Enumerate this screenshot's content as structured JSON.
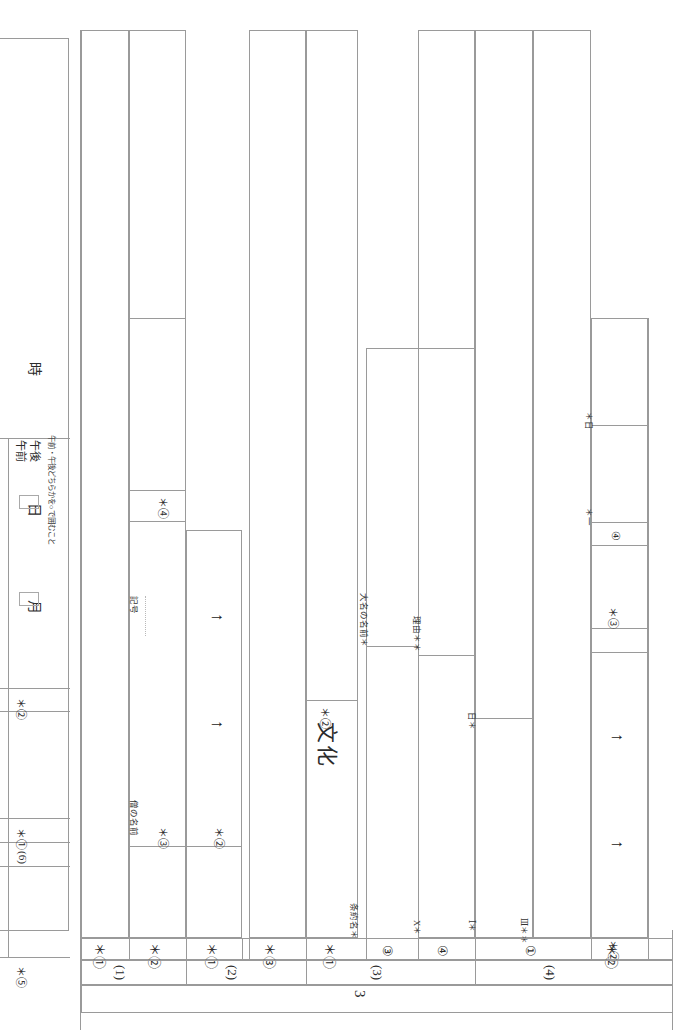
{
  "document": {
    "orientation": "rotated-90-clockwise",
    "type": "japanese-answer-sheet-grading-table",
    "page_number": "3",
    "ink_color": "#2b2b2b",
    "rule_color": "#9a9a9a"
  },
  "header_block": {
    "note": "午前・午後どちらかを○で囲むこと",
    "time_fields": [
      {
        "label": "月"
      },
      {
        "label": "日"
      },
      {
        "label": "時"
      }
    ],
    "ampm": [
      {
        "label": "午前"
      },
      {
        "label": "午後"
      }
    ]
  },
  "left_score_column": {
    "markers": [
      {
        "text": "＊②"
      },
      {
        "text": "＊①"
      },
      {
        "text": "(6)"
      },
      {
        "text": "＊⑤"
      }
    ]
  },
  "answer_columns": [
    {
      "group": "(1)",
      "cells": [
        {
          "label": "",
          "mark": "＊①"
        },
        {
          "label": "僧の名前",
          "mark": "＊③",
          "extra": "記号",
          "big": "文化",
          "sub": "＊④"
        },
        {
          "label": "",
          "mark": "＊②",
          "arrows": 2
        }
      ]
    },
    {
      "group": "(2)",
      "cells": [
        {
          "label": "",
          "mark": "＊①"
        },
        {
          "label": "",
          "mark": "＊③"
        }
      ]
    },
    {
      "group": "(3)",
      "cells": [
        {
          "label": "",
          "mark": "＊①",
          "big": "文化",
          "sub": "＊②"
        },
        {
          "label": "条約名＊",
          "mark": "③"
        },
        {
          "label": "X＊",
          "mark": "④",
          "note2": "大名の名前＊"
        },
        {
          "label": "理由＊＊"
        }
      ]
    },
    {
      "group": "(4)",
      "cells": [
        {
          "label": "Ⅰ＊",
          "mark": "①",
          "note": "日＊"
        },
        {
          "label": "Ⅲ＊＊"
        },
        {
          "label": "",
          "mark": "＊②",
          "arrows": 2,
          "sub": "＊③",
          "sub2": "④",
          "note": "＊日",
          "note2": "＊一"
        }
      ]
    }
  ],
  "bottom_rows": {
    "marks": [
      "＊①",
      "＊②",
      "＊①",
      "＊③",
      "＊①",
      "③",
      "④",
      "①",
      "＊②"
    ],
    "groups": [
      "(1)",
      "(2)",
      "(3)",
      "(4)"
    ],
    "page": "3"
  },
  "glyphs": {
    "arrow_up": "↑",
    "asterisk": "＊",
    "circle_1": "①",
    "circle_2": "②",
    "circle_3": "③",
    "circle_4": "④",
    "circle_5": "⑤"
  }
}
